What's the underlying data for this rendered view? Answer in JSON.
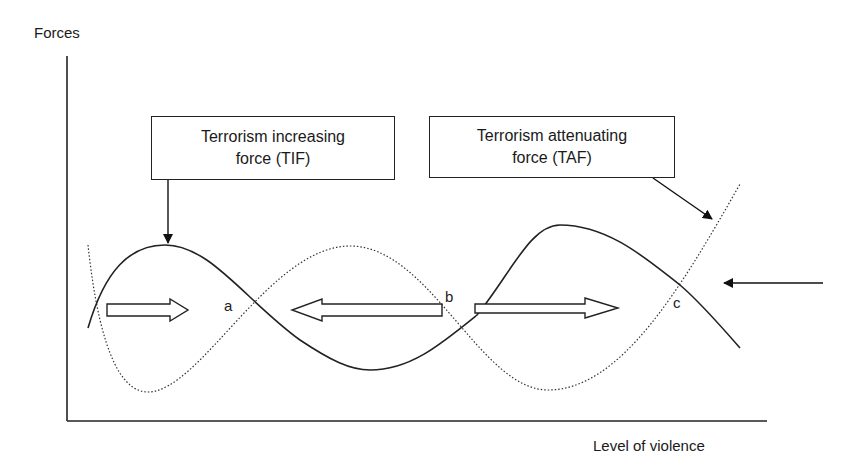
{
  "diagram": {
    "title": "",
    "y_axis_label": "Forces",
    "x_axis_label": "Level of violence",
    "boxes": {
      "tif": {
        "line1": "Terrorism increasing",
        "line2": "force (TIF)"
      },
      "taf": {
        "line1": "Terrorism attenuating",
        "line2": "force (TAF)"
      }
    },
    "points": {
      "a": "a",
      "b": "b",
      "c": "c"
    },
    "curves": [
      {
        "name": "Terrorism increasing force (TIF)",
        "style": "solid"
      },
      {
        "name": "Terrorism attenuating force (TAF)",
        "style": "dotted"
      }
    ],
    "movement_arrows": [
      {
        "direction": "right",
        "region": "left of a"
      },
      {
        "direction": "left",
        "region": "between a and b"
      },
      {
        "direction": "right",
        "region": "between b and c"
      }
    ],
    "external_arrow": {
      "direction": "left",
      "target": "c"
    },
    "colors": {
      "line": "#222222",
      "background": "#ffffff"
    }
  }
}
